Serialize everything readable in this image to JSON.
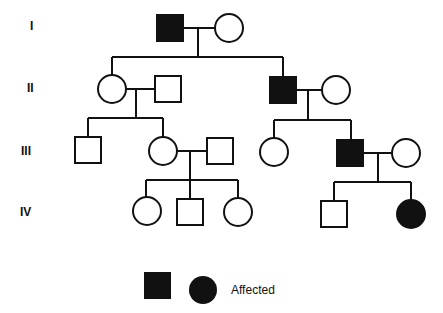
{
  "generations": [
    {
      "label": "I",
      "y": 27
    },
    {
      "label": "II",
      "y": 89
    },
    {
      "label": "III",
      "y": 152
    },
    {
      "label": "IV",
      "y": 213
    }
  ],
  "individuals": [
    {
      "id": "I-1",
      "sex": "male",
      "affected": true,
      "cx": 170,
      "cy": 28
    },
    {
      "id": "I-2",
      "sex": "female",
      "affected": false,
      "cx": 229,
      "cy": 28
    },
    {
      "id": "II-1",
      "sex": "female",
      "affected": false,
      "cx": 112,
      "cy": 89
    },
    {
      "id": "II-2",
      "sex": "male",
      "affected": false,
      "cx": 168,
      "cy": 89
    },
    {
      "id": "II-3",
      "sex": "male",
      "affected": true,
      "cx": 282,
      "cy": 89
    },
    {
      "id": "II-4",
      "sex": "female",
      "affected": false,
      "cx": 336,
      "cy": 90
    },
    {
      "id": "III-1",
      "sex": "male",
      "affected": false,
      "cx": 88,
      "cy": 150
    },
    {
      "id": "III-2",
      "sex": "female",
      "affected": false,
      "cx": 163,
      "cy": 151
    },
    {
      "id": "III-3",
      "sex": "male",
      "affected": false,
      "cx": 220,
      "cy": 151
    },
    {
      "id": "III-4",
      "sex": "female",
      "affected": false,
      "cx": 274,
      "cy": 152
    },
    {
      "id": "III-5",
      "sex": "male",
      "affected": true,
      "cx": 350,
      "cy": 153
    },
    {
      "id": "III-6",
      "sex": "female",
      "affected": false,
      "cx": 406,
      "cy": 153
    },
    {
      "id": "IV-1",
      "sex": "female",
      "affected": false,
      "cx": 147,
      "cy": 211
    },
    {
      "id": "IV-2",
      "sex": "male",
      "affected": false,
      "cx": 190,
      "cy": 212
    },
    {
      "id": "IV-3",
      "sex": "female",
      "affected": false,
      "cx": 238,
      "cy": 212
    },
    {
      "id": "IV-4",
      "sex": "male",
      "affected": false,
      "cx": 334,
      "cy": 214
    },
    {
      "id": "IV-5",
      "sex": "female",
      "affected": true,
      "cx": 411,
      "cy": 214
    }
  ],
  "legend": {
    "label": "Affected",
    "symbols": [
      "affected-male-square",
      "affected-female-circle"
    ]
  }
}
